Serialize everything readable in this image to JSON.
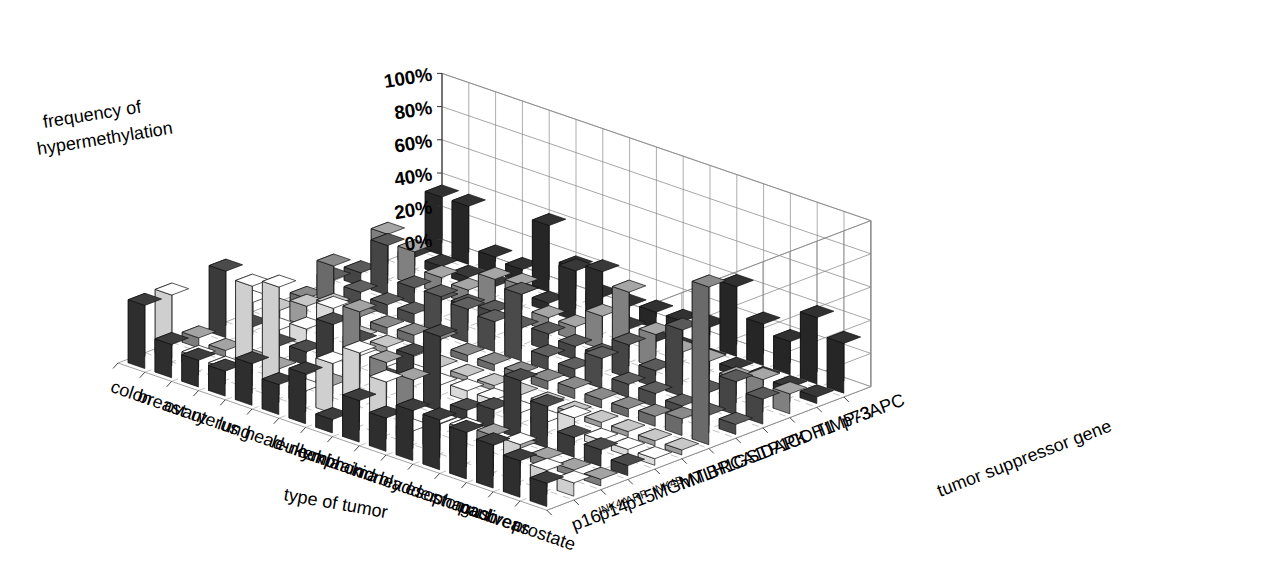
{
  "axes": {
    "value_axis_title_line1": "frequency of",
    "value_axis_title_line2": "hypermethylation",
    "category_axis_title": "type of tumor",
    "series_axis_title": "tumor suppressor gene",
    "value_ticks": [
      "0%",
      "20%",
      "40%",
      "60%",
      "80%",
      "100%"
    ]
  },
  "chart_data": {
    "type": "bar",
    "subtitle": "",
    "xlabel": "type of tumor",
    "ylabel": "frequency of hypermethylation",
    "zlabel": "tumor suppressor gene",
    "ylim": [
      0,
      100
    ],
    "grid": true,
    "legend": "none",
    "projection": "3d-isometric",
    "categories": [
      "colon",
      "breast",
      "ovary",
      "uterus",
      "lung",
      "head-neck",
      "leukemia",
      "lymphoma",
      "brain",
      "kidney",
      "bladder",
      "esophagus",
      "stomach",
      "pancreas",
      "liver",
      "prostate"
    ],
    "series": [
      {
        "name": "p16INK4A",
        "name_base": "p16",
        "name_sup": "INK4A",
        "shade": "#2e2e2e",
        "values": [
          38,
          20,
          16,
          15,
          25,
          18,
          30,
          8,
          25,
          20,
          30,
          30,
          28,
          26,
          22,
          14
        ]
      },
      {
        "name": "p14ARF",
        "name_base": "p14",
        "name_sup": "ARF",
        "shade": "#cfcfcf",
        "values": [
          38,
          6,
          5,
          60,
          65,
          8,
          30,
          42,
          30,
          6,
          16,
          18,
          14,
          20,
          10,
          8
        ]
      },
      {
        "name": "p15INK4B",
        "name_base": "p15",
        "name_sup": "INK4B",
        "shade": "#7d7d7d",
        "values": [
          6,
          4,
          3,
          4,
          6,
          5,
          55,
          30,
          25,
          4,
          6,
          8,
          6,
          5,
          4,
          4
        ]
      },
      {
        "name": "MGMT",
        "name_base": "MGMT",
        "name_sup": "",
        "shade": "#3a3a3a",
        "values": [
          40,
          12,
          6,
          8,
          30,
          25,
          8,
          28,
          45,
          6,
          12,
          35,
          25,
          12,
          10,
          6
        ]
      },
      {
        "name": "hMLH1",
        "name_base": "hMLH1",
        "name_sup": "",
        "shade": "#d9d9d9",
        "values": [
          15,
          4,
          10,
          28,
          5,
          4,
          4,
          4,
          6,
          6,
          4,
          4,
          12,
          4,
          4,
          4
        ]
      },
      {
        "name": "BRCA1",
        "name_base": "BRCA1",
        "name_sup": "",
        "shade": "#9a9a9a",
        "values": [
          4,
          12,
          18,
          4,
          4,
          4,
          3,
          3,
          3,
          3,
          3,
          3,
          3,
          3,
          3,
          3
        ]
      },
      {
        "name": "GSTP1",
        "name_base": "GSTP1",
        "name_sup": "",
        "shade": "#6a6a6a",
        "values": [
          5,
          30,
          5,
          4,
          5,
          8,
          4,
          4,
          4,
          5,
          6,
          5,
          5,
          6,
          10,
          95
        ]
      },
      {
        "name": "DAPK",
        "name_base": "DAPK",
        "name_sup": "",
        "shade": "#4a4a4a",
        "values": [
          10,
          8,
          6,
          6,
          22,
          20,
          18,
          40,
          8,
          6,
          18,
          8,
          8,
          6,
          6,
          6
        ]
      },
      {
        "name": "CDH1",
        "name_base": "CDH1",
        "name_sup": "",
        "shade": "#454545",
        "values": [
          8,
          30,
          10,
          8,
          10,
          12,
          8,
          10,
          8,
          8,
          20,
          10,
          40,
          8,
          20,
          15
        ]
      },
      {
        "name": "TIMP-3",
        "name_base": "TIMP-3",
        "name_sup": "",
        "shade": "#808080",
        "values": [
          25,
          20,
          10,
          8,
          20,
          22,
          8,
          8,
          20,
          40,
          20,
          15,
          15,
          10,
          15,
          12
        ]
      },
      {
        "name": "p73",
        "name_base": "p73",
        "name_sup": "",
        "shade": "#2b2b2b",
        "values": [
          5,
          5,
          4,
          4,
          5,
          5,
          30,
          35,
          6,
          4,
          5,
          4,
          4,
          4,
          4,
          4
        ]
      },
      {
        "name": "APC",
        "name_base": "APC",
        "name_sup": "",
        "shade": "#262626",
        "values": [
          35,
          35,
          10,
          8,
          40,
          20,
          8,
          8,
          10,
          10,
          12,
          42,
          25,
          20,
          40,
          30
        ]
      }
    ]
  }
}
